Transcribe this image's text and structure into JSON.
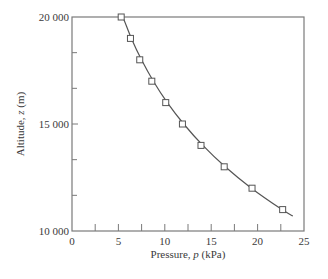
{
  "chart_data": {
    "type": "scatter",
    "title": "",
    "xlabel": "Pressure, p (kPa)",
    "ylabel": "Altitude, z (m)",
    "xlabel_parts": {
      "prefix": "Pressure, ",
      "var": "p",
      "suffix": " (kPa)"
    },
    "ylabel_parts": {
      "prefix": "Altitude, ",
      "var": "z",
      "suffix": " (m)"
    },
    "xlim": [
      0,
      25
    ],
    "ylim": [
      10000,
      20000
    ],
    "x_ticks": [
      0,
      5,
      10,
      15,
      20,
      25
    ],
    "x_tick_labels": [
      "0",
      "5",
      "10",
      "15",
      "20",
      "25"
    ],
    "x_minor_ticks": [
      2.5,
      7.5,
      12.5,
      17.5,
      22.5
    ],
    "y_ticks": [
      10000,
      15000,
      20000
    ],
    "y_tick_labels": [
      "10 000",
      "15 000",
      "20 000"
    ],
    "y_minor_ticks": [
      11666.7,
      13333.3,
      16666.7,
      18333.3
    ],
    "grid": false,
    "legend": null,
    "series": [
      {
        "name": "Measured data",
        "marker": "open-square",
        "x": [
          5.3,
          6.3,
          7.3,
          8.6,
          10.1,
          11.9,
          13.9,
          16.4,
          19.4,
          22.7
        ],
        "y": [
          20000,
          19000,
          18000,
          17000,
          16000,
          15000,
          14000,
          13000,
          12000,
          11000
        ]
      },
      {
        "name": "Fitted curve",
        "marker": "line",
        "x": [
          5.0,
          5.47,
          6.4,
          7.49,
          8.77,
          10.27,
          12.04,
          14.1,
          16.51,
          19.33,
          22.63,
          23.8
        ],
        "y": [
          20300,
          20000,
          19000,
          18000,
          17000,
          16000,
          15000,
          14000,
          13000,
          12000,
          11000,
          10700
        ]
      }
    ]
  },
  "colors": {
    "axis": "#7a7a7a",
    "line": "#555555",
    "marker": "#555555",
    "text": "#3a3a3a"
  }
}
